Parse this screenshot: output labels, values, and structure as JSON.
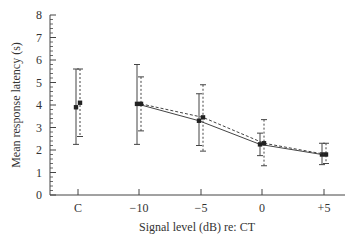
{
  "chart_data": {
    "type": "line",
    "title": "",
    "xlabel": "Signal level (dB) re: CT",
    "ylabel": "Mean response latency (s)",
    "ylim": [
      0,
      8
    ],
    "yticks": [
      0,
      1,
      2,
      3,
      4,
      5,
      6,
      7,
      8
    ],
    "categories": [
      "C",
      "−10",
      "−5",
      "0",
      "+5"
    ],
    "grid": false,
    "legend": null,
    "series": [
      {
        "name": "solid",
        "line_style": "solid",
        "connect_from_index": 1,
        "values": [
          3.9,
          4.05,
          3.3,
          2.25,
          1.8
        ],
        "error_upper": [
          5.6,
          5.8,
          4.5,
          2.75,
          2.3
        ],
        "error_lower": [
          2.25,
          2.25,
          2.2,
          1.75,
          1.35
        ]
      },
      {
        "name": "dashed",
        "line_style": "dashed",
        "connect_from_index": 1,
        "values": [
          4.1,
          4.05,
          3.45,
          2.3,
          1.8
        ],
        "error_upper": [
          5.6,
          5.25,
          4.9,
          3.35,
          2.3
        ],
        "error_lower": [
          2.6,
          2.85,
          1.95,
          1.3,
          1.4
        ]
      }
    ]
  }
}
